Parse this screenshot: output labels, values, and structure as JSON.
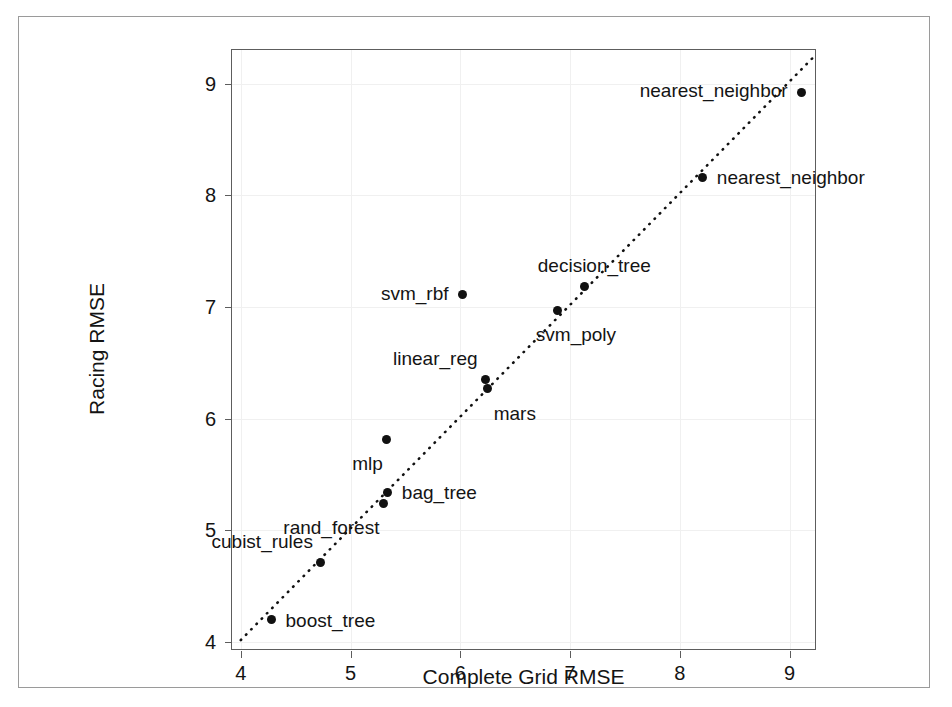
{
  "figure": {
    "background_color": "#ffffff",
    "frame_color": "#9a9a9a",
    "panel_border_color": "#5d5d5d",
    "point_color": "#111111",
    "grid_color": "#f0f0f0"
  },
  "chart_data": {
    "type": "scatter",
    "title": "",
    "xlabel": "Complete Grid RMSE",
    "ylabel": "Racing RMSE",
    "xlim": [
      3.92,
      9.25
    ],
    "ylim": [
      3.92,
      9.3
    ],
    "xticks": [
      4,
      5,
      6,
      7,
      8,
      9
    ],
    "yticks": [
      4,
      5,
      6,
      7,
      8,
      9
    ],
    "xtick_labels": [
      "4",
      "5",
      "6",
      "7",
      "8",
      "9"
    ],
    "ytick_labels": [
      "4",
      "5",
      "6",
      "7",
      "8",
      "9"
    ],
    "grid": false,
    "legend": null,
    "reference_line": {
      "style": "dotted",
      "slope": 1,
      "intercept": 0,
      "from": [
        4.0,
        4.0
      ],
      "to": [
        9.25,
        9.25
      ]
    },
    "points": [
      {
        "label": "nearest_neighbor",
        "x": 9.11,
        "y": 8.92,
        "label_side": "left"
      },
      {
        "label": "nearest_neighbor",
        "x": 8.21,
        "y": 8.16,
        "label_side": "right"
      },
      {
        "label": "decision_tree",
        "x": 7.13,
        "y": 7.18,
        "label_side": "above"
      },
      {
        "label": "svm_poly",
        "x": 6.89,
        "y": 6.97,
        "label_side": "below"
      },
      {
        "label": "svm_rbf",
        "x": 6.02,
        "y": 7.11,
        "label_side": "left"
      },
      {
        "label": "linear_reg",
        "x": 6.23,
        "y": 6.35,
        "label_side": "above-left"
      },
      {
        "label": "mars",
        "x": 6.25,
        "y": 6.27,
        "label_side": "below-right"
      },
      {
        "label": "mlp",
        "x": 5.33,
        "y": 5.81,
        "label_side": "below-left"
      },
      {
        "label": "bag_tree",
        "x": 5.34,
        "y": 5.34,
        "label_side": "right"
      },
      {
        "label": "rand_forest",
        "x": 5.3,
        "y": 5.24,
        "label_side": "below-left"
      },
      {
        "label": "cubist_rules",
        "x": 4.73,
        "y": 4.71,
        "label_side": "above-left"
      },
      {
        "label": "boost_tree",
        "x": 4.28,
        "y": 4.2,
        "label_side": "right"
      }
    ]
  }
}
